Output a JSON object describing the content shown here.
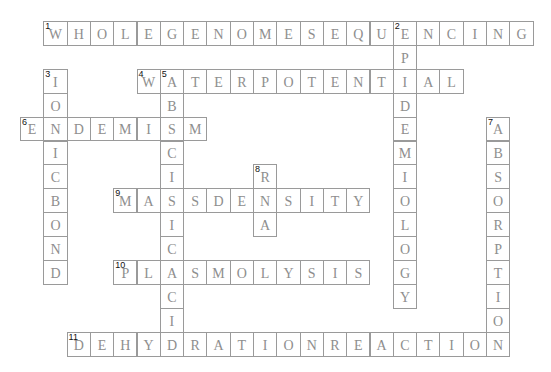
{
  "grid": {
    "origin_x": 20,
    "origin_y": 21,
    "cell_w": 23.3,
    "cell_h": 23.9
  },
  "colors": {
    "border": "#9a9a9a",
    "letter": "#8e8e8e",
    "number": "#111111",
    "background": "#ffffff"
  },
  "entries": [
    {
      "number": "1",
      "direction": "across",
      "row": 0,
      "col": 1,
      "answer": "WHOLEGENOMESEQUENCING"
    },
    {
      "number": "2",
      "direction": "down",
      "row": 0,
      "col": 16,
      "answer": "EPIDEMIOLOGY"
    },
    {
      "number": "3",
      "direction": "down",
      "row": 2,
      "col": 1,
      "answer": "IONICBOND"
    },
    {
      "number": "4",
      "direction": "across",
      "row": 2,
      "col": 5,
      "answer": "WATERPOTENTIAL"
    },
    {
      "number": "5",
      "direction": "down",
      "row": 2,
      "col": 6,
      "answer": "ABSCISICACID"
    },
    {
      "number": "6",
      "direction": "across",
      "row": 4,
      "col": 0,
      "answer": "ENDEMISM"
    },
    {
      "number": "7",
      "direction": "down",
      "row": 4,
      "col": 20,
      "answer": "ABSORPTION"
    },
    {
      "number": "8",
      "direction": "down",
      "row": 6,
      "col": 10,
      "answer": "RNA"
    },
    {
      "number": "9",
      "direction": "across",
      "row": 7,
      "col": 4,
      "answer": "MASSDENSITY"
    },
    {
      "number": "10",
      "direction": "across",
      "row": 10,
      "col": 4,
      "answer": "PLASMOLYSIS"
    },
    {
      "number": "11",
      "direction": "across",
      "row": 13,
      "col": 2,
      "answer": "DEHYDRATIONREACTION"
    }
  ]
}
